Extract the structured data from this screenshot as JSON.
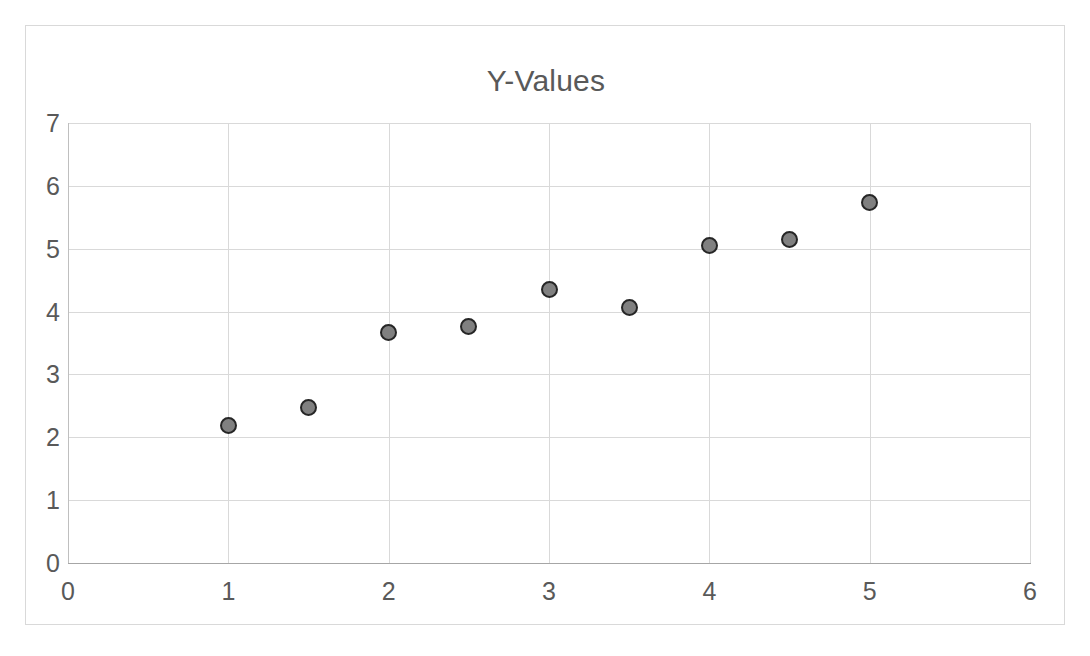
{
  "chart_data": {
    "type": "scatter",
    "title": "Y-Values",
    "xlabel": "",
    "ylabel": "",
    "xlim": [
      0,
      6
    ],
    "ylim": [
      0,
      7
    ],
    "x_ticks": [
      "0",
      "1",
      "2",
      "3",
      "4",
      "5",
      "6"
    ],
    "y_ticks": [
      "0",
      "1",
      "2",
      "3",
      "4",
      "5",
      "6",
      "7"
    ],
    "grid": true,
    "legend": "none",
    "series": [
      {
        "name": "Y-Values",
        "marker_fill": "#808080",
        "marker_edge": "#262626",
        "points": [
          {
            "x": 1,
            "y": 2.19
          },
          {
            "x": 1.5,
            "y": 2.47
          },
          {
            "x": 2,
            "y": 3.66
          },
          {
            "x": 2.5,
            "y": 3.76
          },
          {
            "x": 3,
            "y": 4.35
          },
          {
            "x": 3.5,
            "y": 4.06
          },
          {
            "x": 4,
            "y": 5.05
          },
          {
            "x": 4.5,
            "y": 5.14
          },
          {
            "x": 5,
            "y": 5.74
          }
        ]
      }
    ]
  },
  "style": {
    "plot_border": "#d9d9d9",
    "gridline_color": "#d9d9d9",
    "axis_color": "#a6a6a6",
    "text_color": "#595959",
    "background": "#ffffff"
  }
}
